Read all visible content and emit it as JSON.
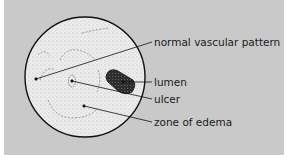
{
  "figure": {
    "labels": [
      {
        "id": "normal-vascular-pattern",
        "text": "normal vascular pattern"
      },
      {
        "id": "lumen",
        "text": "lumen"
      },
      {
        "id": "ulcer",
        "text": "ulcer"
      },
      {
        "id": "zone-of-edema",
        "text": "zone of edema"
      }
    ]
  },
  "colors": {
    "background": "#c9c9c9",
    "circle_fill": "#ececec",
    "outline": "#111111",
    "lumen": "#3a3a3a"
  }
}
